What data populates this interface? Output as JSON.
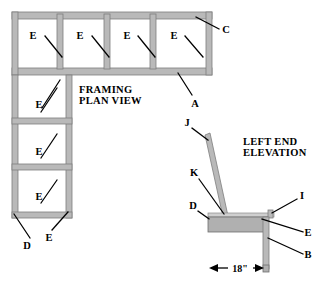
{
  "drawing": {
    "titles": {
      "plan": {
        "line1": "FRAMING",
        "line2": "PLAN VIEW"
      },
      "elevation": {
        "line1": "LEFT END",
        "line2": "ELEVATION"
      }
    },
    "colors": {
      "member": "#b9b9b9",
      "member_outline": "#7d7d7d",
      "plate": "#cfcfcf",
      "leader": "#000000",
      "background": "#ffffff"
    },
    "plan_callouts": [
      {
        "id": "plan-e-1",
        "label": "E"
      },
      {
        "id": "plan-e-2",
        "label": "E"
      },
      {
        "id": "plan-e-3",
        "label": "E"
      },
      {
        "id": "plan-e-4",
        "label": "E"
      },
      {
        "id": "plan-c",
        "label": "C"
      },
      {
        "id": "plan-a",
        "label": "A"
      },
      {
        "id": "plan-e-5",
        "label": "E"
      },
      {
        "id": "plan-e-6",
        "label": "E"
      },
      {
        "id": "plan-e-7",
        "label": "E"
      },
      {
        "id": "plan-e-8",
        "label": "E"
      },
      {
        "id": "plan-d",
        "label": "D"
      }
    ],
    "elevation_callouts": [
      {
        "id": "elev-j",
        "label": "J"
      },
      {
        "id": "elev-k",
        "label": "K"
      },
      {
        "id": "elev-d",
        "label": "D"
      },
      {
        "id": "elev-i",
        "label": "I"
      },
      {
        "id": "elev-e",
        "label": "E"
      },
      {
        "id": "elev-b",
        "label": "B"
      }
    ],
    "dimensions": [
      {
        "id": "elev-width-dim",
        "value": "18\""
      }
    ]
  }
}
